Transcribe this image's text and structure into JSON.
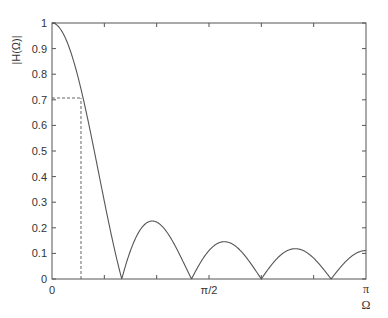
{
  "chart_data": {
    "type": "line",
    "title": "",
    "xlabel": "Ω",
    "ylabel": "|H(Ω)|",
    "xlim": [
      0,
      3.14159
    ],
    "ylim": [
      0,
      1
    ],
    "grid": false,
    "legend": null,
    "x_tick_labels": [
      {
        "value": 0,
        "label": "0"
      },
      {
        "value": 1.5708,
        "label": "π/2"
      },
      {
        "value": 3.14159,
        "label": "π"
      }
    ],
    "x_minor_ticks_rad": [
      0.5236,
      1.0472,
      1.5708,
      2.0944,
      2.618
    ],
    "y_ticks": [
      0,
      0.1,
      0.2,
      0.3,
      0.4,
      0.5,
      0.6,
      0.7,
      0.8,
      0.9,
      1
    ],
    "y_tick_labels": [
      "0",
      "0.1",
      "0.2",
      "0.3",
      "0.4",
      "0.5",
      "0.6",
      "0.7",
      "0.8",
      "0.9",
      "1"
    ],
    "series": [
      {
        "name": "|H(Ω)|",
        "description": "Magnitude of 9-point moving average: |sin(9Ω/2) / (9 sin(Ω/2))|",
        "N": 9,
        "x": [
          0,
          0.1,
          0.2,
          0.29,
          0.4,
          0.5,
          0.6,
          0.698,
          0.9,
          1.047,
          1.2,
          1.396,
          1.571,
          1.745,
          2.094,
          2.443,
          2.793,
          3.1416
        ],
        "values": [
          1.0,
          0.966,
          0.872,
          0.716,
          0.509,
          0.296,
          0.099,
          0.0,
          0.186,
          0.222,
          0.153,
          0.0,
          0.143,
          0.0,
          0.0,
          0.0,
          0.0,
          0.111
        ],
        "zeros_rad": [
          0.698,
          1.396,
          2.094,
          2.793
        ],
        "sidelobe_peaks": [
          0.222,
          0.143,
          0.12,
          0.111
        ],
        "color": "#555555"
      }
    ],
    "annotations": [
      {
        "type": "dashed-horizontal",
        "y": 0.707,
        "x_from": 0,
        "x_to": 0.29
      },
      {
        "type": "dashed-vertical",
        "x": 0.29,
        "y_from": 0,
        "y_to": 0.707
      }
    ]
  },
  "labels": {
    "ylabel": "|H(Ω)|",
    "xlabel": "Ω",
    "x0": "0",
    "xmid": "π/2",
    "xpi": "π"
  }
}
